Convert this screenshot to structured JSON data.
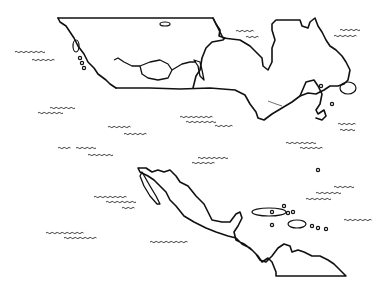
{
  "map": {
    "title": "",
    "style": "outline line-art",
    "stroke_color": "#111111",
    "background": "#ffffff",
    "regions": [
      {
        "name": "canada-northwest",
        "path": "M58,18 L213,18 L216,24 L220,30 L219,36 L225,38 L223,40 L212,42 L206,48 L202,58 L200,70 L196,76 L193,88"
      },
      {
        "name": "west-coast",
        "path": "M58,18 L60,22 L66,26 L70,32 L74,38 L78,46 L84,54 L88,62 L94,68 L98,74 L106,80 L110,84 L116,88"
      },
      {
        "name": "us-canada-border",
        "path": "M116,88 L150,88 L180,89 L210,88 L235,90 L245,95 L250,104 L256,112 L258,118 L264,120 L272,114 L282,108 L292,102 L300,96 L308,93 L316,94 L320,92"
      },
      {
        "name": "hudson-region",
        "path": "M213,18 L223,38 L240,40 L250,46 L256,52 L262,58 L263,66 L268,70 L272,62 L272,48 L275,40 L272,30 L272,24 L276,20 L300,20 L302,26 L308,28 L310,22 L315,18 L318,26 L322,32 L326,40 L330,46 L336,50 L342,56 L346,62 L350,70 L348,80 L344,84 L338,86 L330,86 L324,90 L320,92"
      },
      {
        "name": "maritimes",
        "path": "M300,96 L306,82 L314,80 L318,86 L322,94 L320,104 L316,110 L318,114 L324,110 L326,116 L322,120 L316,118"
      },
      {
        "name": "mexico-central-america",
        "path": "M138,168 L146,168 L152,172 L158,170 L164,172 L170,170 L176,176 L180,182 L188,186 L196,196 L204,204 L208,212 L212,220 L222,222 L230,222 L236,214 L240,212 L242,218 L238,226 L234,232 L236,240 L244,244 L252,250 L258,256 L262,262 L268,258 L272,262 L276,272 L276,276 L346,276 L340,270 L334,264 L328,260 L320,256 L312,256 L304,252 L298,250 L292,252 L290,246 L284,244 L278,248 L272,256 L266,262 L260,260 L256,254 L250,248 L242,244 L236,238 L228,236 L216,232 L206,228 L194,222 L184,216 L176,206 L170,200 L166,192 L160,186 L154,180 L148,176 L140,172 Z"
      }
    ],
    "inner_lines": [
      {
        "name": "prairie-lake",
        "path": "M140,66 L150,62 L160,60 L168,64 L172,70 L168,78 L158,80 L148,78 L142,74 Z"
      },
      {
        "name": "west-inner",
        "path": "M114,60 L118,58 L124,62 L132,66 L140,66 M172,70 L182,64 L190,62 L196,62"
      },
      {
        "name": "baja",
        "path": "M142,172 L150,186 L156,196 L160,204 L157,204 L150,196 L144,186 L140,176 Z"
      },
      {
        "name": "great-lake-strait",
        "path": "M194,60 L198,66 L200,76 L204,80 L202,70 L200,62 Z"
      }
    ],
    "islands": [
      {
        "name": "vancouver-island",
        "x": 73,
        "y": 40,
        "w": 6,
        "h": 12
      },
      {
        "name": "island-north",
        "x": 160,
        "y": 22,
        "w": 10,
        "h": 4
      },
      {
        "name": "newfoundland",
        "x": 340,
        "y": 82,
        "w": 16,
        "h": 12
      },
      {
        "name": "cuba",
        "x": 252,
        "y": 208,
        "w": 34,
        "h": 8
      },
      {
        "name": "hispaniola",
        "x": 288,
        "y": 220,
        "w": 18,
        "h": 8
      }
    ],
    "water_marks": [
      {
        "x": 15,
        "y": 52,
        "w": 30
      },
      {
        "x": 32,
        "y": 60,
        "w": 22
      },
      {
        "x": 50,
        "y": 108,
        "w": 24
      },
      {
        "x": 38,
        "y": 113,
        "w": 24
      },
      {
        "x": 108,
        "y": 127,
        "w": 22
      },
      {
        "x": 124,
        "y": 134,
        "w": 22
      },
      {
        "x": 180,
        "y": 117,
        "w": 32
      },
      {
        "x": 186,
        "y": 122,
        "w": 30
      },
      {
        "x": 215,
        "y": 126,
        "w": 16
      },
      {
        "x": 236,
        "y": 31,
        "w": 16
      },
      {
        "x": 246,
        "y": 37,
        "w": 12
      },
      {
        "x": 340,
        "y": 30,
        "w": 18
      },
      {
        "x": 334,
        "y": 36,
        "w": 22
      },
      {
        "x": 338,
        "y": 124,
        "w": 16
      },
      {
        "x": 340,
        "y": 130,
        "w": 14
      },
      {
        "x": 58,
        "y": 148,
        "w": 12
      },
      {
        "x": 76,
        "y": 148,
        "w": 20
      },
      {
        "x": 88,
        "y": 155,
        "w": 24
      },
      {
        "x": 198,
        "y": 158,
        "w": 28
      },
      {
        "x": 192,
        "y": 163,
        "w": 22
      },
      {
        "x": 286,
        "y": 143,
        "w": 30
      },
      {
        "x": 300,
        "y": 148,
        "w": 22
      },
      {
        "x": 94,
        "y": 197,
        "w": 32
      },
      {
        "x": 106,
        "y": 202,
        "w": 30
      },
      {
        "x": 122,
        "y": 208,
        "w": 12
      },
      {
        "x": 334,
        "y": 187,
        "w": 20
      },
      {
        "x": 316,
        "y": 193,
        "w": 24
      },
      {
        "x": 306,
        "y": 199,
        "w": 24
      },
      {
        "x": 344,
        "y": 220,
        "w": 26
      },
      {
        "x": 46,
        "y": 233,
        "w": 36
      },
      {
        "x": 64,
        "y": 238,
        "w": 32
      },
      {
        "x": 150,
        "y": 242,
        "w": 36
      }
    ],
    "small_dots": [
      {
        "x": 80,
        "y": 58
      },
      {
        "x": 82,
        "y": 63
      },
      {
        "x": 84,
        "y": 68
      },
      {
        "x": 321,
        "y": 86
      },
      {
        "x": 332,
        "y": 104
      },
      {
        "x": 318,
        "y": 170
      },
      {
        "x": 272,
        "y": 212
      },
      {
        "x": 284,
        "y": 206
      },
      {
        "x": 288,
        "y": 213
      },
      {
        "x": 293,
        "y": 212
      },
      {
        "x": 272,
        "y": 225
      },
      {
        "x": 312,
        "y": 226
      },
      {
        "x": 318,
        "y": 228
      },
      {
        "x": 326,
        "y": 229
      }
    ]
  }
}
